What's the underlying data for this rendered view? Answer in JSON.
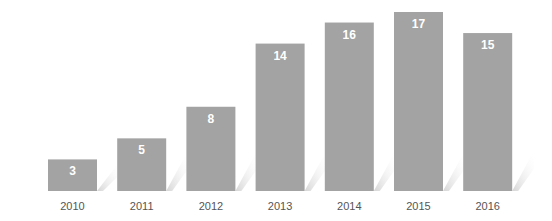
{
  "chart_data": {
    "type": "bar",
    "title": "",
    "xlabel": "",
    "ylabel": "",
    "categories": [
      "2010",
      "2011",
      "2012",
      "2013",
      "2014",
      "2015",
      "2016"
    ],
    "values": [
      3,
      5,
      8,
      14,
      16,
      17,
      15
    ],
    "data_labels": [
      "3",
      "5",
      "8",
      "14",
      "16",
      "17",
      "15"
    ],
    "ylim": [
      0,
      17
    ],
    "grid": false,
    "legend": "none",
    "colors": {
      "bar": "#a3a3a3",
      "data_label": "#ffffff",
      "tick_label": "#555555",
      "shadow": "#dcdcdc"
    }
  }
}
